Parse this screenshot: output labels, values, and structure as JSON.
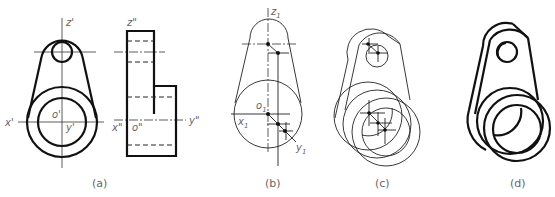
{
  "figure": {
    "panels": [
      {
        "id": "a",
        "caption": "(a)",
        "description": "Orthographic front and side views with reference axes",
        "axis_labels": {
          "z_front": "z'",
          "x_front": "x'",
          "origin_front": "o'",
          "y_front": "y'",
          "z_side": "z\"",
          "x_side": "x\"",
          "origin_side": "o\"",
          "y_side": "y\""
        }
      },
      {
        "id": "b",
        "caption": "(b)",
        "description": "Axonometric axes construction",
        "axis_labels": {
          "z": "z",
          "z_sub": "1",
          "x": "x",
          "x_sub": "1",
          "origin": "o",
          "origin_sub": "1",
          "y": "y",
          "y_sub": "1"
        }
      },
      {
        "id": "c",
        "caption": "(c)",
        "description": "Thin construction isometric drawing"
      },
      {
        "id": "d",
        "caption": "(d)",
        "description": "Finished pictorial drawing with thick outlines"
      }
    ]
  }
}
